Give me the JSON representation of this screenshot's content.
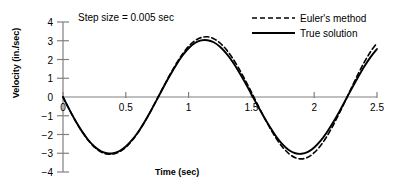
{
  "chart_data": {
    "type": "line",
    "title": "",
    "annotation": "Step size = 0.005 sec",
    "xlabel": "Time (sec)",
    "ylabel": "Velocity (in./sec)",
    "xlim": [
      0,
      2.5
    ],
    "ylim": [
      -4,
      4
    ],
    "xticks": [
      0,
      0.5,
      1,
      1.5,
      2,
      2.5
    ],
    "xticklabels": [
      "0",
      "0.5",
      "1",
      "1.5",
      "2",
      "2.5"
    ],
    "yticks": [
      -4,
      -3,
      -2,
      -1,
      0,
      1,
      2,
      3,
      4
    ],
    "yticklabels": [
      "-4",
      "-3",
      "-2",
      "-1",
      "0",
      "1",
      "2",
      "3",
      "4"
    ],
    "grid": false,
    "legend_position": "top-right",
    "series": [
      {
        "name": "Euler's method",
        "style": "dashed",
        "color": "#000000",
        "x": [
          0,
          0.05,
          0.1,
          0.15,
          0.2,
          0.25,
          0.3,
          0.35,
          0.4,
          0.45,
          0.5,
          0.55,
          0.6,
          0.65,
          0.7,
          0.75,
          0.8,
          0.85,
          0.9,
          0.95,
          1.0,
          1.05,
          1.1,
          1.15,
          1.2,
          1.25,
          1.3,
          1.35,
          1.4,
          1.45,
          1.5,
          1.55,
          1.6,
          1.65,
          1.7,
          1.75,
          1.8,
          1.85,
          1.9,
          1.95,
          2.0,
          2.05,
          2.1,
          2.15,
          2.2,
          2.25,
          2.3,
          2.35,
          2.4,
          2.45,
          2.5
        ],
        "y": [
          0,
          -0.66,
          -1.28,
          -1.83,
          -2.3,
          -2.67,
          -2.92,
          -3.04,
          -3.04,
          -2.92,
          -2.68,
          -2.32,
          -1.87,
          -1.33,
          -0.73,
          -0.1,
          0.55,
          1.18,
          1.76,
          2.28,
          2.7,
          3.0,
          3.17,
          3.21,
          3.11,
          2.88,
          2.53,
          2.07,
          1.52,
          0.91,
          0.26,
          -0.41,
          -1.06,
          -1.68,
          -2.23,
          -2.69,
          -3.03,
          -3.24,
          -3.3,
          -3.21,
          -2.97,
          -2.6,
          -2.11,
          -1.52,
          -0.87,
          -0.17,
          0.54,
          1.23,
          1.87,
          2.43,
          2.88
        ]
      },
      {
        "name": "True solution",
        "style": "solid",
        "color": "#000000",
        "x": [
          0,
          0.05,
          0.1,
          0.15,
          0.2,
          0.25,
          0.3,
          0.35,
          0.4,
          0.45,
          0.5,
          0.55,
          0.6,
          0.65,
          0.7,
          0.75,
          0.8,
          0.85,
          0.9,
          0.95,
          1.0,
          1.05,
          1.1,
          1.15,
          1.2,
          1.25,
          1.3,
          1.35,
          1.4,
          1.45,
          1.5,
          1.55,
          1.6,
          1.65,
          1.7,
          1.75,
          1.8,
          1.85,
          1.9,
          1.95,
          2.0,
          2.05,
          2.1,
          2.15,
          2.2,
          2.25,
          2.3,
          2.35,
          2.4,
          2.45,
          2.5
        ],
        "y": [
          0,
          -0.66,
          -1.28,
          -1.82,
          -2.28,
          -2.64,
          -2.88,
          -3.0,
          -3.0,
          -2.88,
          -2.64,
          -2.29,
          -1.85,
          -1.32,
          -0.73,
          -0.11,
          0.52,
          1.13,
          1.7,
          2.2,
          2.6,
          2.88,
          3.02,
          3.03,
          2.92,
          2.68,
          2.33,
          1.88,
          1.35,
          0.77,
          0.15,
          -0.47,
          -1.07,
          -1.63,
          -2.13,
          -2.54,
          -2.84,
          -3.0,
          -3.03,
          -2.93,
          -2.69,
          -2.34,
          -1.89,
          -1.36,
          -0.78,
          -0.16,
          0.47,
          1.07,
          1.64,
          2.14,
          2.56
        ]
      }
    ]
  },
  "legend": {
    "items": [
      {
        "label": "Euler's method",
        "style": "dashed"
      },
      {
        "label": "True solution",
        "style": "solid"
      }
    ]
  }
}
